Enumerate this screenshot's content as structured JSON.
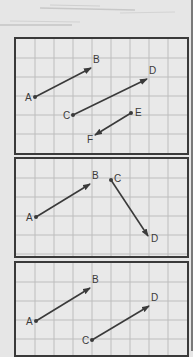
{
  "colors": {
    "background": "#e6e6e6",
    "panel_bg": "#e9e9e9",
    "grid": "#bdbdbd",
    "border": "#3a3a3a",
    "vector": "#3a3a3a",
    "label": "#3a3a3a"
  },
  "grid": {
    "cell_size": 19,
    "columns": 9,
    "rows": 6
  },
  "panels": [
    {
      "id": "panel-1",
      "vectors": [
        {
          "from": "A",
          "to": "B"
        },
        {
          "from": "C",
          "to": "D"
        },
        {
          "from": "E",
          "to": "F"
        }
      ],
      "points": [
        {
          "label": "A",
          "x": 19,
          "y": 58
        },
        {
          "label": "B",
          "x": 75,
          "y": 29
        },
        {
          "label": "C",
          "x": 57,
          "y": 76
        },
        {
          "label": "D",
          "x": 131,
          "y": 40
        },
        {
          "label": "E",
          "x": 115,
          "y": 74
        },
        {
          "label": "F",
          "x": 79,
          "y": 96
        }
      ]
    },
    {
      "id": "panel-2",
      "vectors": [
        {
          "from": "A",
          "to": "B"
        },
        {
          "from": "C",
          "to": "D"
        }
      ],
      "points": [
        {
          "label": "A",
          "x": 20,
          "y": 58
        },
        {
          "label": "B",
          "x": 74,
          "y": 25
        },
        {
          "label": "C",
          "x": 95,
          "y": 21
        },
        {
          "label": "D",
          "x": 132,
          "y": 77
        }
      ]
    },
    {
      "id": "panel-3",
      "vectors": [
        {
          "from": "A",
          "to": "B"
        },
        {
          "from": "C",
          "to": "D"
        }
      ],
      "points": [
        {
          "label": "A",
          "x": 20,
          "y": 58
        },
        {
          "label": "B",
          "x": 74,
          "y": 25
        },
        {
          "label": "C",
          "x": 76,
          "y": 77
        },
        {
          "label": "D",
          "x": 133,
          "y": 43
        }
      ]
    }
  ]
}
